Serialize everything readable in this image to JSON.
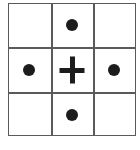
{
  "diagram": {
    "type": "3x3 grid",
    "rows": 3,
    "cols": 3,
    "line_color": "#5a5a5a",
    "mark_color": "#1c1c1c",
    "cells": [
      [
        "empty",
        "dot",
        "empty"
      ],
      [
        "dot",
        "plus",
        "dot"
      ],
      [
        "empty",
        "dot",
        "empty"
      ]
    ]
  }
}
